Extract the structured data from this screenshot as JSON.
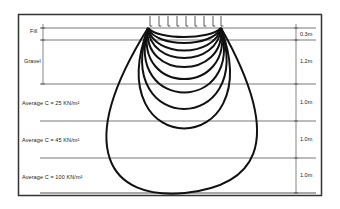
{
  "diagram": {
    "layers": [
      {
        "label": "Fill",
        "thickness": "0.3m"
      },
      {
        "label": "Gravel",
        "thickness": "1.2m"
      },
      {
        "label": "Average  C = 25 KN/m²",
        "thickness": "1.0m"
      },
      {
        "label": "Average  C = 45 KN/m²",
        "thickness": "1.0m"
      },
      {
        "label": "Average  C = 100 KN/m²",
        "thickness": "1.0m"
      }
    ],
    "load_arrows": 9,
    "bulb_count": 10,
    "colors": {
      "line": "#111111",
      "frame": "#333333",
      "layer_line": "#555555"
    }
  }
}
